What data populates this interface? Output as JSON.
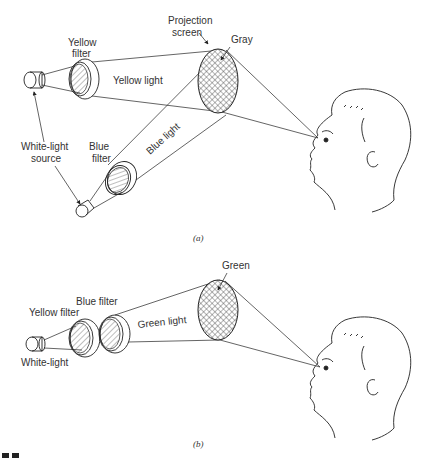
{
  "panel_a": {
    "caption": "(a)",
    "labels": {
      "projection_screen_line1": "Projection",
      "projection_screen_line2": "screen",
      "gray": "Gray",
      "yellow_filter_line1": "Yellow",
      "yellow_filter_line2": "filter",
      "yellow_light": "Yellow light",
      "blue_light": "Blue light",
      "white_light_source_line1": "White-light",
      "white_light_source_line2": "source",
      "blue_filter_line1": "Blue",
      "blue_filter_line2": "filter"
    }
  },
  "panel_b": {
    "caption": "(b)",
    "labels": {
      "green": "Green",
      "blue_filter": "Blue filter",
      "yellow_filter": "Yellow filter",
      "green_light": "Green light",
      "white_light": "White-light"
    }
  },
  "colors": {
    "ink": "#222222",
    "background": "#ffffff"
  }
}
